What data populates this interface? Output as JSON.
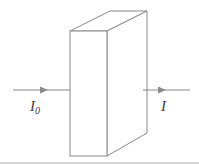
{
  "figure": {
    "background_color": "#ffffff",
    "width": 199,
    "height": 164,
    "line_color": "#8a8a8a",
    "text_color": "#3d3d3d",
    "rule_color": "#d6d6d6"
  },
  "labels": {
    "incident_beam": "I",
    "incident_beam_subscript": "0",
    "transmitted_beam": "I"
  },
  "geometry": {
    "slab": {
      "shape": "rectangular-cuboid-oblique",
      "front_face": {
        "left": 70,
        "right": 107,
        "top": 31,
        "bottom": 156
      },
      "depth_offset": {
        "dx": 40,
        "dy": -20
      },
      "back_top_left": {
        "x": 110,
        "y": 11
      },
      "back_top_right": {
        "x": 147,
        "y": 11
      },
      "back_bottom_right": {
        "x": 147,
        "y": 133
      }
    },
    "arrow_incident": {
      "x1": 13,
      "y1": 90,
      "x2": 70,
      "y2": 90,
      "head_x": 47
    },
    "arrow_transmitted": {
      "x1": 143,
      "y1": 90,
      "x2": 190,
      "y2": 90,
      "head_x": 165
    }
  }
}
